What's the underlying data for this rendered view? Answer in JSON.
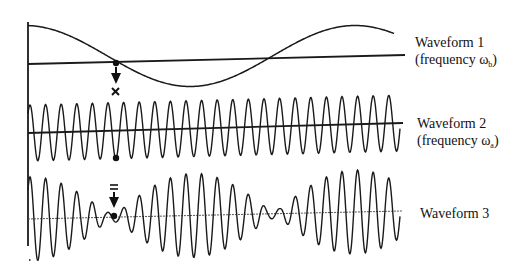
{
  "diagram": {
    "axis": {
      "x": 28,
      "y_top": 22,
      "y_bottom": 246
    },
    "waveforms": [
      {
        "id": "waveform-1",
        "label": "Waveform 1",
        "sublabel_prefix": "(frequency ω",
        "sublabel_subscript": "b",
        "sublabel_suffix": ")",
        "x_start": 28,
        "x_end": 394,
        "center_y": 56,
        "amplitude": 30.5,
        "period_px": 330,
        "phase_peak_x": 355,
        "baseline": {
          "x1": 28,
          "y1": 64,
          "x2": 405,
          "y2": 55
        },
        "marker": {
          "dot_x": 116,
          "dot_y": 63,
          "symbol": "×"
        }
      },
      {
        "id": "waveform-2",
        "label": "Waveform 2",
        "sublabel_prefix": "(frequency ω",
        "sublabel_subscript": "a",
        "sublabel_suffix": ")",
        "x_start": 28,
        "x_end": 400,
        "amplitude": 28,
        "period_px": 15.6,
        "phase_peak_x": 30,
        "baseline": {
          "x1": 28,
          "y1": 133,
          "x2": 403,
          "y2": 123
        },
        "marker": {
          "dot_x": 116,
          "dot_y": 158
        }
      },
      {
        "id": "waveform-3",
        "label": "Waveform 3",
        "x_start": 28,
        "x_end": 400,
        "max_amplitude": 42,
        "period_px": 15.6,
        "phase_peak_x": 30,
        "envelope_max_x": 193,
        "envelope_node_spacing": 162,
        "baseline": {
          "x1": 28,
          "y1": 219,
          "x2": 402,
          "y2": 211
        },
        "marker": {
          "dot_x": 114,
          "dot_y": 216,
          "symbol": "="
        }
      }
    ]
  }
}
